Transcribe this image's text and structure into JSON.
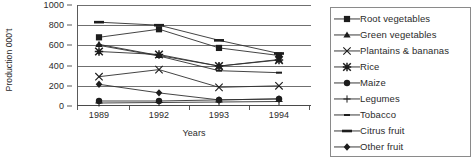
{
  "chart_data": {
    "type": "line",
    "title": "",
    "xlabel": "Years",
    "ylabel": "Production 000't",
    "categories": [
      "1989",
      "1992",
      "1993",
      "1994"
    ],
    "ylim": [
      0,
      1000
    ],
    "yticks": [
      0,
      200,
      400,
      600,
      800,
      1000
    ],
    "grid": true,
    "legend_position": "right",
    "series": [
      {
        "name": "Root vegetables",
        "marker": "filled-square",
        "values": [
          680,
          760,
          575,
          500
        ]
      },
      {
        "name": "Green vegetables",
        "marker": "filled-triangle",
        "values": [
          610,
          500,
          395,
          460
        ]
      },
      {
        "name": "Plantains & bananas",
        "marker": "thin-cross",
        "values": [
          290,
          360,
          185,
          200
        ]
      },
      {
        "name": "Rice",
        "marker": "bold-asterisk",
        "values": [
          540,
          510,
          395,
          455
        ]
      },
      {
        "name": "Maize",
        "marker": "filled-circle",
        "values": [
          50,
          50,
          60,
          70
        ]
      },
      {
        "name": "Legumes",
        "marker": "plus",
        "values": [
          30,
          35,
          40,
          45
        ]
      },
      {
        "name": "Tobacco",
        "marker": "small-dash",
        "values": [
          600,
          495,
          350,
          330
        ]
      },
      {
        "name": "Citrus fruit",
        "marker": "thick-dash",
        "values": [
          830,
          800,
          650,
          520
        ]
      },
      {
        "name": "Other fruit",
        "marker": "filled-diamond",
        "values": [
          215,
          130,
          60,
          70
        ]
      }
    ]
  },
  "axis": {
    "y_tick_labels": [
      "1000",
      "800",
      "600",
      "400",
      "200",
      "0"
    ],
    "y_title": "Production 000't",
    "x_tick_labels": [
      "1989",
      "1992",
      "1993",
      "1994"
    ],
    "x_title": "Years"
  },
  "legend": {
    "items": [
      {
        "label": "Root vegetables"
      },
      {
        "label": "Green vegetables"
      },
      {
        "label": "Plantains & bananas"
      },
      {
        "label": "Rice"
      },
      {
        "label": "Maize"
      },
      {
        "label": "Legumes"
      },
      {
        "label": "Tobacco"
      },
      {
        "label": "Citrus fruit"
      },
      {
        "label": "Other fruit"
      }
    ]
  },
  "colors": {
    "ink": "#2b2b2b",
    "line": "#3a3a3a",
    "grid": "#6f6f6f",
    "legend_border": "#8a8a8a"
  }
}
